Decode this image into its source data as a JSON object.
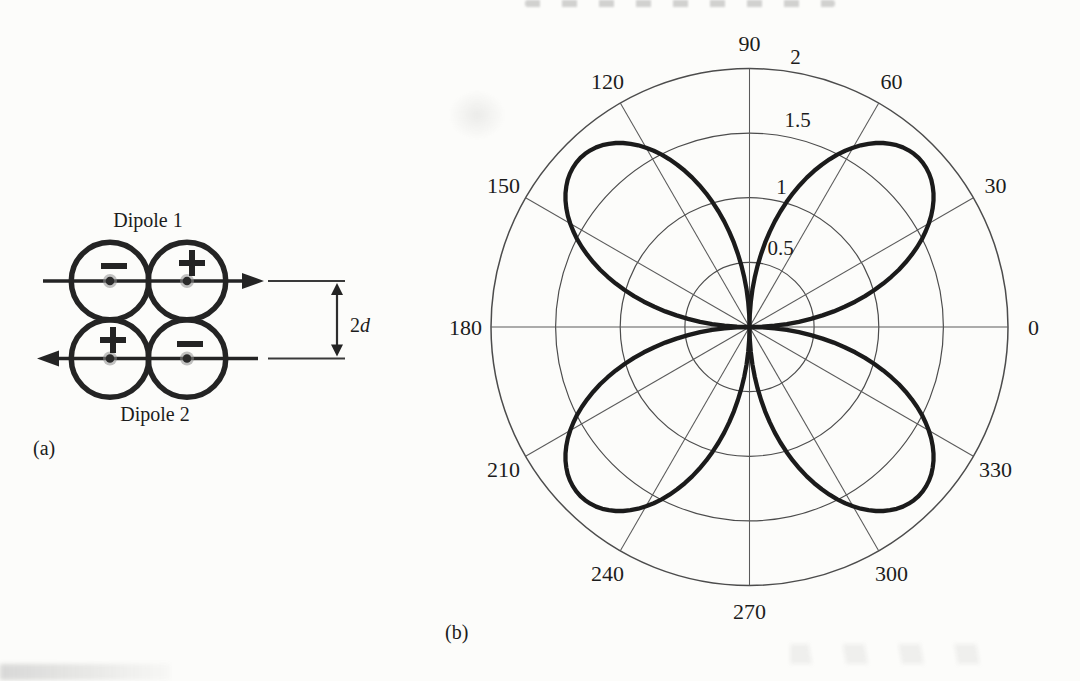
{
  "page": {
    "background_color": "#fcfcfa",
    "ink_color": "#1c1c1c",
    "grid_color": "#4c4c4c",
    "curve_color": "#1b1b1b"
  },
  "figure": {
    "panel_a": {
      "label": "(a)",
      "dipole1_label": "Dipole 1",
      "dipole2_label": "Dipole 2",
      "separation_label": {
        "coefficient": "2",
        "variable": "d"
      },
      "sources": [
        {
          "dipole": "Dipole 1",
          "position": "left",
          "sign": "−"
        },
        {
          "dipole": "Dipole 1",
          "position": "right",
          "sign": "+"
        },
        {
          "dipole": "Dipole 2",
          "position": "left",
          "sign": "+"
        },
        {
          "dipole": "Dipole 2",
          "position": "right",
          "sign": "−"
        }
      ],
      "arrow_directions": {
        "dipole1": "right",
        "dipole2": "left"
      }
    },
    "panel_b": {
      "label": "(b)"
    }
  },
  "chart_data": {
    "type": "line",
    "subtype": "polar",
    "title": "",
    "angle_unit": "degrees",
    "angle_ticks": [
      0,
      30,
      60,
      90,
      120,
      150,
      180,
      210,
      240,
      270,
      300,
      330
    ],
    "radial_ticks": [
      0.5,
      1,
      1.5,
      2
    ],
    "r_range": [
      0,
      2
    ],
    "grid": true,
    "legend": null,
    "series": [
      {
        "name": "quadrupole directivity pattern",
        "formula": "r(theta) = A*|sin(2*theta)|",
        "amplitude": 1.85,
        "harmonic": 2,
        "lobe_axes_deg": [
          45,
          135,
          225,
          315
        ],
        "points_deg_r": [
          [
            0,
            0
          ],
          [
            10,
            0.63
          ],
          [
            20,
            1.19
          ],
          [
            30,
            1.6
          ],
          [
            40,
            1.82
          ],
          [
            45,
            1.85
          ],
          [
            50,
            1.82
          ],
          [
            60,
            1.6
          ],
          [
            70,
            1.19
          ],
          [
            80,
            0.63
          ],
          [
            90,
            0
          ],
          [
            100,
            0.63
          ],
          [
            110,
            1.19
          ],
          [
            120,
            1.6
          ],
          [
            130,
            1.82
          ],
          [
            135,
            1.85
          ],
          [
            140,
            1.82
          ],
          [
            150,
            1.6
          ],
          [
            160,
            1.19
          ],
          [
            170,
            0.63
          ],
          [
            180,
            0
          ],
          [
            190,
            0.63
          ],
          [
            200,
            1.19
          ],
          [
            210,
            1.6
          ],
          [
            220,
            1.82
          ],
          [
            225,
            1.85
          ],
          [
            230,
            1.82
          ],
          [
            240,
            1.6
          ],
          [
            250,
            1.19
          ],
          [
            260,
            0.63
          ],
          [
            270,
            0
          ],
          [
            280,
            0.63
          ],
          [
            290,
            1.19
          ],
          [
            300,
            1.6
          ],
          [
            310,
            1.82
          ],
          [
            315,
            1.85
          ],
          [
            320,
            1.82
          ],
          [
            330,
            1.6
          ],
          [
            340,
            1.19
          ],
          [
            350,
            0.63
          ],
          [
            360,
            0
          ]
        ]
      }
    ]
  }
}
